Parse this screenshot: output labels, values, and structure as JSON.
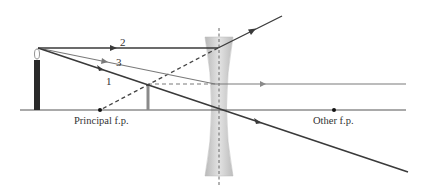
{
  "diagram": {
    "type": "ray-diagram",
    "colors": {
      "background": "#ffffff",
      "axis": "#555555",
      "ray_dark": "#3a3a3a",
      "ray_gray": "#7a7a7a",
      "lens_fill": "#c8c8c8",
      "candle": "#2a2a2a",
      "image": "#8a8a8a"
    },
    "labels": {
      "principal_fp": "Principal f.p.",
      "other_fp": "Other f.p.",
      "ray1": "1",
      "ray2": "2",
      "ray3": "3"
    },
    "elements": {
      "object": "candle",
      "image": "virtual upright reduced image",
      "lens": "diverging lens",
      "focal_points": [
        "Principal f.p.",
        "Other f.p."
      ]
    }
  }
}
